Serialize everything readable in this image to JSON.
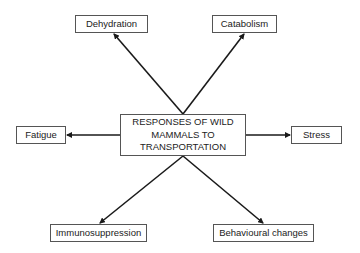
{
  "diagram": {
    "center": {
      "lines": [
        "RESPONSES OF WILD",
        "MAMMALS TO",
        "TRANSPORTATION"
      ]
    },
    "nodes": {
      "dehydration": "Dehydration",
      "catabolism": "Catabolism",
      "fatigue": "Fatigue",
      "stress": "Stress",
      "immunosuppression": "Immunosuppression",
      "behavioural_changes": "Behavioural changes"
    },
    "edges": [
      {
        "from": "center",
        "to": "dehydration"
      },
      {
        "from": "center",
        "to": "catabolism"
      },
      {
        "from": "center",
        "to": "fatigue"
      },
      {
        "from": "center",
        "to": "stress"
      },
      {
        "from": "center",
        "to": "immunosuppression"
      },
      {
        "from": "center",
        "to": "behavioural_changes"
      }
    ],
    "colors": {
      "arrow": "#1a1a1a",
      "box_border": "#555555",
      "background": "#ffffff"
    }
  }
}
